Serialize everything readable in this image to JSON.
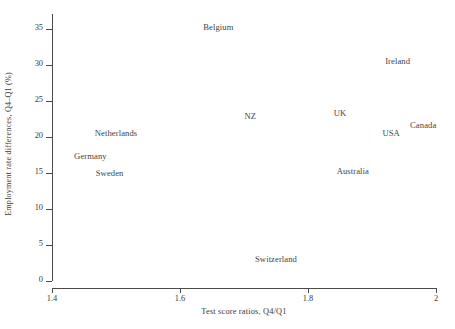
{
  "chart_data": {
    "type": "scatter",
    "title": "",
    "xlabel": "Test score ratios, Q4/Q1",
    "ylabel": "Employment rate differences, Q4–Q1 (%)",
    "xlim": [
      1.4,
      2.0
    ],
    "ylim": [
      0,
      36.5
    ],
    "xticks": [
      "1.4",
      "1.6",
      "1.8",
      "2"
    ],
    "xtick_values": [
      1.4,
      1.6,
      1.8,
      2.0
    ],
    "yticks": [
      "0",
      "5",
      "10",
      "15",
      "20",
      "25",
      "30",
      "35"
    ],
    "ytick_values": [
      0,
      5,
      10,
      15,
      20,
      25,
      30,
      35
    ],
    "grid": false,
    "legend": "none",
    "marker_style": "text-label-only",
    "points": [
      {
        "label": "Belgium",
        "x": 1.66,
        "y": 35.2
      },
      {
        "label": "Ireland",
        "x": 1.94,
        "y": 30.6
      },
      {
        "label": "NZ",
        "x": 1.71,
        "y": 22.9
      },
      {
        "label": "UK",
        "x": 1.85,
        "y": 23.3
      },
      {
        "label": "Canada",
        "x": 1.98,
        "y": 21.6
      },
      {
        "label": "USA",
        "x": 1.93,
        "y": 20.5
      },
      {
        "label": "Netherlands",
        "x": 1.5,
        "y": 20.5
      },
      {
        "label": "Germany",
        "x": 1.46,
        "y": 17.4
      },
      {
        "label": "Sweden",
        "x": 1.49,
        "y": 15.0
      },
      {
        "label": "Australia",
        "x": 1.87,
        "y": 15.2
      },
      {
        "label": "Switzerland",
        "x": 1.75,
        "y": 3.0
      }
    ]
  }
}
